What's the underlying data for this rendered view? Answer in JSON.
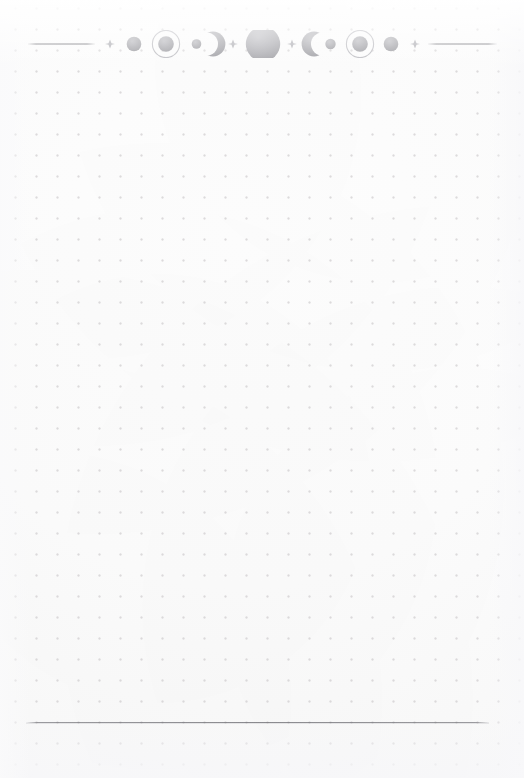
{
  "page": {
    "kind": "dot-grid-journal-page",
    "width": 524,
    "height": 778,
    "background_color": "#fdfdfd",
    "dot_color": "#c9c6c8",
    "dot_spacing_px": 21,
    "dot_radius_px": 1
  },
  "header_ornament": {
    "name": "moon-phase-divider",
    "center_y": 44,
    "ink_color": "#9a9a9f",
    "accent_color": "#b4b4b9",
    "rule_color": "#6b6b71",
    "left_rule": {
      "x1": 28,
      "x2": 95,
      "y": 44
    },
    "right_rule": {
      "x1": 428,
      "x2": 497,
      "y": 44
    },
    "elements": [
      {
        "icon": "horizontal-rule",
        "label": "left rule",
        "cx": 61.5,
        "r": 0
      },
      {
        "icon": "sparkle-icon",
        "label": "four-point sparkle",
        "cx": 110,
        "r": 4.0
      },
      {
        "icon": "moon-waxing-gibbous",
        "label": "small disc",
        "cx": 134,
        "r": 7.5
      },
      {
        "icon": "moon-full-ringed",
        "label": "ringed full moon",
        "cx": 166,
        "r": 8.0,
        "ring_r": 14.5
      },
      {
        "icon": "moon-new-dot",
        "label": "tiny disc",
        "cx": 196,
        "r": 5.0
      },
      {
        "icon": "moon-waxing-crescent",
        "label": "right-facing crescent",
        "cx": 213,
        "r": 12.5
      },
      {
        "icon": "sparkle-icon",
        "label": "four-point sparkle",
        "cx": 233,
        "r": 4.0
      },
      {
        "icon": "moon-full-large",
        "label": "large full moon",
        "cx": 263,
        "r": 17.5
      },
      {
        "icon": "sparkle-icon",
        "label": "four-point sparkle",
        "cx": 292,
        "r": 4.0
      },
      {
        "icon": "moon-waning-crescent",
        "label": "left-facing crescent",
        "cx": 314,
        "r": 12.5
      },
      {
        "icon": "moon-new-dot",
        "label": "tiny disc",
        "cx": 330,
        "r": 5.5
      },
      {
        "icon": "moon-full-ringed",
        "label": "ringed full moon",
        "cx": 360,
        "r": 8.0,
        "ring_r": 14.5
      },
      {
        "icon": "moon-waxing-gibbous",
        "label": "small disc",
        "cx": 391,
        "r": 7.5
      },
      {
        "icon": "sparkle-icon",
        "label": "four-point sparkle",
        "cx": 415,
        "r": 4.0
      },
      {
        "icon": "horizontal-rule",
        "label": "right rule",
        "cx": 462.5,
        "r": 0
      }
    ]
  },
  "footer": {
    "name": "footer-rule",
    "y": 722,
    "x1": 26,
    "x2": 489,
    "color": "#68686e"
  },
  "writing_area": {
    "name": "note-area",
    "top": 60,
    "bottom": 716,
    "content": ""
  }
}
